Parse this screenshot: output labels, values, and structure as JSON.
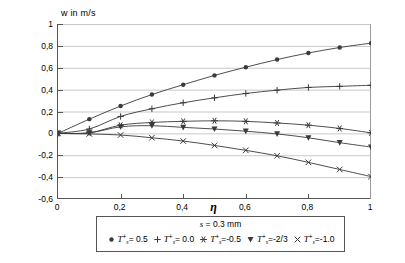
{
  "chart_data": {
    "type": "line",
    "title": "",
    "xlabel": "η",
    "ylabel": "w in m/s",
    "xlim": [
      0,
      1
    ],
    "ylim": [
      -0.6,
      1
    ],
    "grid": true,
    "legend_position": "bottom",
    "x_ticks": [
      "0",
      "0,2",
      "0,4",
      "0,6",
      "0,8",
      "1"
    ],
    "x_tick_values": [
      0,
      0.2,
      0.4,
      0.6,
      0.8,
      1
    ],
    "y_ticks": [
      "1",
      "0,8",
      "0,6",
      "0,4",
      "0,2",
      "0",
      "-0,2",
      "-0,4",
      "-0,6"
    ],
    "y_tick_values": [
      1,
      0.8,
      0.6,
      0.4,
      0.2,
      0,
      -0.2,
      -0.4,
      -0.6
    ],
    "x": [
      0,
      0.1,
      0.2,
      0.3,
      0.4,
      0.5,
      0.6,
      0.7,
      0.8,
      0.9,
      1.0
    ],
    "series": [
      {
        "name": "Ts+ = 0.5",
        "marker": "filled-circle",
        "values": [
          0,
          0.13,
          0.25,
          0.355,
          0.445,
          0.53,
          0.605,
          0.675,
          0.735,
          0.785,
          0.825
        ]
      },
      {
        "name": "Ts+ = 0.0",
        "marker": "plus",
        "values": [
          0,
          0.04,
          0.155,
          0.225,
          0.28,
          0.325,
          0.365,
          0.395,
          0.42,
          0.43,
          0.44
        ]
      },
      {
        "name": "Ts+ = -0.5",
        "marker": "star",
        "values": [
          0,
          0.005,
          0.075,
          0.1,
          0.11,
          0.115,
          0.11,
          0.095,
          0.075,
          0.045,
          0.005
        ]
      },
      {
        "name": "Ts+ = -2/3",
        "marker": "filled-triangle-down",
        "values": [
          0,
          0.005,
          0.06,
          0.07,
          0.055,
          0.04,
          0.02,
          -0.005,
          -0.04,
          -0.085,
          -0.125
        ]
      },
      {
        "name": "Ts+ = -1.0",
        "marker": "cross",
        "values": [
          0,
          -0.005,
          -0.015,
          -0.04,
          -0.07,
          -0.11,
          -0.155,
          -0.205,
          -0.265,
          -0.33,
          -0.395
        ]
      }
    ]
  },
  "axes": {
    "y_axis_title": "w in m/s",
    "x_axis_title": "η"
  },
  "legend": {
    "condition": {
      "symbol": "s",
      "equals": "= 0.3 mm",
      "full": "s = 0.3 mm"
    },
    "entries": [
      {
        "symbol": "T",
        "subscript": "s",
        "superscript": "+",
        "value": "= 0.5",
        "marker": "filled-circle"
      },
      {
        "symbol": "T",
        "subscript": "s",
        "superscript": "+",
        "value": "= 0.0",
        "marker": "plus"
      },
      {
        "symbol": "T",
        "subscript": "s",
        "superscript": "+",
        "value": "=-0.5",
        "marker": "star"
      },
      {
        "symbol": "T",
        "subscript": "s",
        "superscript": "+",
        "value": "=-2/3",
        "marker": "filled-triangle-down"
      },
      {
        "symbol": "T",
        "subscript": "s",
        "superscript": "+",
        "value": "=-1.0",
        "marker": "cross"
      }
    ]
  },
  "colors": {
    "line": "#3a3a3a",
    "axis": "#555555",
    "grid": "#c9c9c9",
    "text": "#000000",
    "background": "#ffffff"
  }
}
